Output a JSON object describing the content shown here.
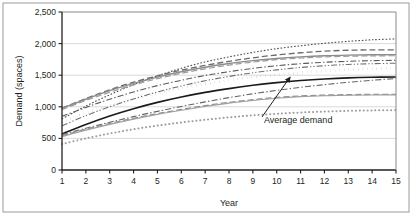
{
  "chart_data": {
    "type": "line",
    "title": "",
    "xlabel": "Year",
    "ylabel": "Demand (spaces)",
    "xlim": [
      1,
      15
    ],
    "ylim": [
      0,
      2500
    ],
    "xticks": [
      "1",
      "2",
      "3",
      "4",
      "5",
      "6",
      "7",
      "8",
      "9",
      "10",
      "11",
      "12",
      "13",
      "14",
      "15"
    ],
    "yticks": [
      "0",
      "500",
      "1,000",
      "1,500",
      "2,000",
      "2,500"
    ],
    "ytick_values": [
      0,
      500,
      1000,
      1500,
      2000,
      2500
    ],
    "grid": "horizontal",
    "legend": "none",
    "x": [
      1,
      2,
      3,
      4,
      5,
      6,
      7,
      8,
      9,
      10,
      11,
      12,
      13,
      14,
      15
    ],
    "annotations": [
      {
        "text": "Average demand",
        "points_to_series": "Average demand",
        "points_to_x": 10.6,
        "points_to_y": 1500
      }
    ],
    "series": [
      {
        "name": "Scenario 1",
        "style": "dotted",
        "color": "#4d4d4d",
        "width": 1.1,
        "values": [
          810,
          1010,
          1190,
          1350,
          1490,
          1610,
          1710,
          1790,
          1860,
          1920,
          1965,
          2005,
          2035,
          2060,
          2075
        ]
      },
      {
        "name": "Scenario 2",
        "style": "dashed-long",
        "color": "#6b6b6b",
        "width": 1.3,
        "values": [
          980,
          1130,
          1270,
          1390,
          1490,
          1580,
          1655,
          1720,
          1775,
          1820,
          1855,
          1880,
          1895,
          1900,
          1900
        ]
      },
      {
        "name": "Scenario 3",
        "style": "solid",
        "color": "#8c8c8c",
        "width": 1.4,
        "values": [
          975,
          1120,
          1255,
          1370,
          1470,
          1555,
          1625,
          1685,
          1730,
          1765,
          1790,
          1808,
          1818,
          1823,
          1825
        ]
      },
      {
        "name": "Scenario 4",
        "style": "dashed-long",
        "color": "#9a9a9a",
        "width": 1.2,
        "values": [
          955,
          1100,
          1230,
          1345,
          1445,
          1530,
          1600,
          1660,
          1708,
          1745,
          1772,
          1790,
          1800,
          1806,
          1808
        ]
      },
      {
        "name": "Scenario 5",
        "style": "dash-dot",
        "color": "#5a5a5a",
        "width": 1.1,
        "values": [
          850,
          990,
          1120,
          1235,
          1335,
          1420,
          1495,
          1555,
          1608,
          1650,
          1682,
          1705,
          1720,
          1730,
          1735
        ]
      },
      {
        "name": "Scenario 6",
        "style": "dash-dot-dot",
        "color": "#707070",
        "width": 1.1,
        "values": [
          700,
          860,
          1000,
          1125,
          1235,
          1330,
          1412,
          1480,
          1538,
          1585,
          1622,
          1650,
          1670,
          1682,
          1690
        ]
      },
      {
        "name": "Average demand",
        "style": "square-dotted",
        "color": "#1a1a1a",
        "width": 2.6,
        "values": [
          760,
          900,
          1020,
          1125,
          1215,
          1295,
          1362,
          1420,
          1468,
          1508,
          1542,
          1568,
          1588,
          1602,
          1612
        ]
      },
      {
        "name": "Scenario 7",
        "style": "solid",
        "color": "#1a1a1a",
        "width": 1.6,
        "values": [
          570,
          720,
          855,
          970,
          1070,
          1155,
          1228,
          1288,
          1340,
          1382,
          1415,
          1440,
          1458,
          1468,
          1472
        ]
      },
      {
        "name": "Scenario 8",
        "style": "dash-dot",
        "color": "#666666",
        "width": 1.1,
        "values": [
          560,
          660,
          755,
          845,
          928,
          1005,
          1078,
          1145,
          1205,
          1260,
          1308,
          1350,
          1388,
          1420,
          1448
        ]
      },
      {
        "name": "Scenario 9",
        "style": "dashed-long",
        "color": "#8f8f8f",
        "width": 1.3,
        "values": [
          545,
          645,
          735,
          818,
          892,
          958,
          1018,
          1070,
          1112,
          1148,
          1172,
          1185,
          1192,
          1196,
          1198
        ]
      },
      {
        "name": "Scenario 10",
        "style": "solid",
        "color": "#a0a0a0",
        "width": 1.2,
        "values": [
          530,
          630,
          722,
          805,
          880,
          945,
          1005,
          1058,
          1100,
          1135,
          1160,
          1175,
          1183,
          1187,
          1189
        ]
      },
      {
        "name": "Scenario 11",
        "style": "dotted-round",
        "color": "#9c9c9c",
        "width": 2.0,
        "values": [
          410,
          500,
          578,
          645,
          702,
          752,
          795,
          833,
          865,
          890,
          910,
          925,
          936,
          943,
          948
        ]
      }
    ]
  },
  "axes": {
    "y_label": "Demand (spaces)",
    "x_label": "Year"
  },
  "colors": {
    "frame": "#231f20",
    "gridline": "#d9d9d9",
    "border": "#9b9b9b",
    "text": "#231f20"
  }
}
